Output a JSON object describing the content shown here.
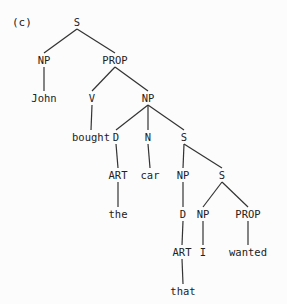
{
  "figure_label": "(c)",
  "tree": {
    "nodes": [
      {
        "id": "s0",
        "label": "S",
        "x": 77,
        "y": 22
      },
      {
        "id": "np1",
        "label": "NP",
        "x": 44,
        "y": 60
      },
      {
        "id": "prop1",
        "label": "PROP",
        "x": 115,
        "y": 60
      },
      {
        "id": "john",
        "label": "John",
        "x": 44,
        "y": 98
      },
      {
        "id": "v",
        "label": "V",
        "x": 92,
        "y": 98
      },
      {
        "id": "np2",
        "label": "NP",
        "x": 148,
        "y": 98
      },
      {
        "id": "bought",
        "label": "bought",
        "x": 91,
        "y": 137
      },
      {
        "id": "d1",
        "label": "D",
        "x": 116,
        "y": 137
      },
      {
        "id": "n",
        "label": "N",
        "x": 148,
        "y": 137
      },
      {
        "id": "s1",
        "label": "S",
        "x": 184,
        "y": 137
      },
      {
        "id": "art1",
        "label": "ART",
        "x": 118,
        "y": 175
      },
      {
        "id": "car",
        "label": "car",
        "x": 150,
        "y": 175
      },
      {
        "id": "np3",
        "label": "NP",
        "x": 183,
        "y": 175
      },
      {
        "id": "s2",
        "label": "S",
        "x": 222,
        "y": 175
      },
      {
        "id": "the",
        "label": "the",
        "x": 118,
        "y": 214
      },
      {
        "id": "d2",
        "label": "D",
        "x": 183,
        "y": 214
      },
      {
        "id": "np4",
        "label": "NP",
        "x": 203,
        "y": 214
      },
      {
        "id": "prop2",
        "label": "PROP",
        "x": 248,
        "y": 214
      },
      {
        "id": "art2",
        "label": "ART",
        "x": 182,
        "y": 252
      },
      {
        "id": "i",
        "label": "I",
        "x": 203,
        "y": 252
      },
      {
        "id": "wanted",
        "label": "wanted",
        "x": 248,
        "y": 252
      },
      {
        "id": "that",
        "label": "that",
        "x": 183,
        "y": 291
      }
    ],
    "edges": [
      [
        "s0",
        "np1"
      ],
      [
        "s0",
        "prop1"
      ],
      [
        "np1",
        "john"
      ],
      [
        "prop1",
        "v"
      ],
      [
        "prop1",
        "np2"
      ],
      [
        "v",
        "bought"
      ],
      [
        "np2",
        "d1"
      ],
      [
        "np2",
        "n"
      ],
      [
        "np2",
        "s1"
      ],
      [
        "d1",
        "art1"
      ],
      [
        "n",
        "car"
      ],
      [
        "s1",
        "np3"
      ],
      [
        "s1",
        "s2"
      ],
      [
        "art1",
        "the"
      ],
      [
        "np3",
        "d2"
      ],
      [
        "s2",
        "np4"
      ],
      [
        "s2",
        "prop2"
      ],
      [
        "d2",
        "art2"
      ],
      [
        "np4",
        "i"
      ],
      [
        "prop2",
        "wanted"
      ],
      [
        "art2",
        "that"
      ]
    ]
  }
}
